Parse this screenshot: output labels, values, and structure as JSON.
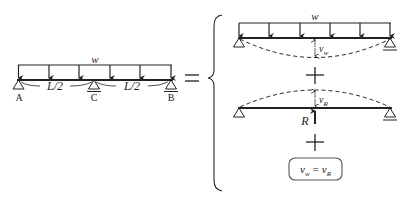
{
  "diagram": {
    "type": "superposition of beam deflections",
    "left_beam": {
      "load_label": "w",
      "supports": [
        {
          "label": "A",
          "type": "pin"
        },
        {
          "label": "C",
          "type": "roller"
        },
        {
          "label": "B",
          "type": "roller"
        }
      ],
      "span_labels": [
        "L/2",
        "L/2"
      ]
    },
    "equals": "=",
    "right_top_beam": {
      "load_label": "w",
      "deflection_label": "v",
      "deflection_sub": "w"
    },
    "plus_1": "+",
    "right_middle_beam": {
      "force_label": "R",
      "deflection_label": "v",
      "deflection_sub": "R"
    },
    "plus_2": "+",
    "condition_box": {
      "lhs": "v",
      "lhs_sub": "w",
      "op": "=",
      "rhs": "v",
      "rhs_sub": "R"
    }
  },
  "colors": {
    "line": "#222222",
    "box_border": "#555555"
  }
}
